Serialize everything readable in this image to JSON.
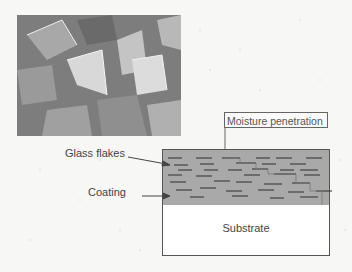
{
  "figure": {
    "photo": {
      "description": "SEM micrograph of glass flakes"
    },
    "labels": {
      "moisture": "Moisture penetration",
      "glass_flakes": "Glass flakes",
      "coating": "Coating",
      "substrate": "Substrate"
    },
    "colors": {
      "coating_fill": "#a9a9a9",
      "flake_line": "#444444",
      "substrate_fill": "#ffffff",
      "outline": "#555555"
    }
  }
}
